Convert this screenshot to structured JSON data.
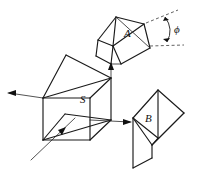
{
  "figure": {
    "background_color": "#ffffff",
    "line_color": "#1a1a1a",
    "width": 201,
    "height": 179
  },
  "labels": {
    "prism_a": "A",
    "cube_s": "S",
    "prism_b": "B",
    "angle_phi": "ϕ"
  },
  "components": [
    {
      "id": "prism-a",
      "name": "prism-a",
      "label": "A",
      "description": "Upper-right roof prism drawn in oblique projection"
    },
    {
      "id": "cube-s",
      "name": "beam-splitter-cube-s",
      "label": "S",
      "description": "Central cube with internal diagonal splitting plane"
    },
    {
      "id": "prism-b",
      "name": "prism-b",
      "label": "B",
      "description": "Lower-right prism drawn in oblique projection"
    }
  ],
  "rays": [
    {
      "id": "ray-input-bottom-left",
      "name": "input-ray",
      "direction": "up-right",
      "arrow": true
    },
    {
      "id": "ray-output-left",
      "name": "output-ray-left",
      "direction": "left",
      "arrow": true
    },
    {
      "id": "ray-output-right",
      "name": "output-ray-right",
      "direction": "right",
      "arrow": true
    },
    {
      "id": "ray-up-to-a",
      "name": "ray-to-prism-a",
      "direction": "up",
      "arrow": true
    }
  ],
  "annotations": {
    "angle": {
      "symbol": "ϕ",
      "guide_lines": 2,
      "guide_style": "dashed",
      "arc": true
    }
  }
}
